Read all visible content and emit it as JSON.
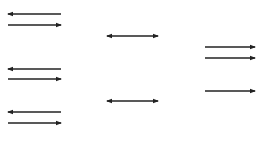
{
  "diagram": {
    "type": "arrow-pairs",
    "stroke_color": "#222222",
    "background": "#ffffff",
    "columns": [
      {
        "name": "left",
        "arrows": [
          {
            "direction": "left",
            "x1": 8,
            "x2": 61,
            "y": 14
          },
          {
            "direction": "right",
            "x1": 8,
            "x2": 61,
            "y": 25
          },
          {
            "direction": "left",
            "x1": 8,
            "x2": 61,
            "y": 69
          },
          {
            "direction": "right",
            "x1": 8,
            "x2": 61,
            "y": 79
          },
          {
            "direction": "left",
            "x1": 8,
            "x2": 61,
            "y": 112
          },
          {
            "direction": "right",
            "x1": 8,
            "x2": 61,
            "y": 123
          }
        ]
      },
      {
        "name": "middle",
        "arrows": [
          {
            "direction": "both",
            "x1": 107,
            "x2": 158,
            "y": 36
          },
          {
            "direction": "both",
            "x1": 107,
            "x2": 158,
            "y": 101
          }
        ]
      },
      {
        "name": "right",
        "arrows": [
          {
            "direction": "right",
            "x1": 205,
            "x2": 255,
            "y": 47
          },
          {
            "direction": "right",
            "x1": 205,
            "x2": 255,
            "y": 58
          },
          {
            "direction": "right",
            "x1": 205,
            "x2": 255,
            "y": 91
          }
        ]
      }
    ]
  }
}
